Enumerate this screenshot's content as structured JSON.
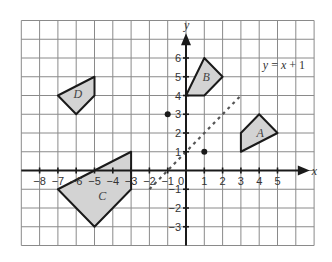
{
  "diagram": {
    "type": "coordinate-grid",
    "grid": {
      "x_min": -9,
      "x_max": 7,
      "y_min": -4,
      "y_max": 8,
      "origin_px": [
        186,
        170.5
      ],
      "unit_px_x": 18.3,
      "unit_px_y": 18.75,
      "grid_color": "#8a8a8a"
    },
    "axes": {
      "x_label": "x",
      "y_label": "y",
      "origin_label": "0",
      "x_ticks": [
        -8,
        -7,
        -6,
        -5,
        -4,
        -3,
        -2,
        -1,
        1,
        2,
        3,
        4,
        5
      ],
      "x_tick_labels": [
        "−8",
        "−7",
        "−6",
        "−5",
        "−4",
        "−3",
        "−2",
        "−1",
        "1",
        "2",
        "3",
        "4",
        "5"
      ],
      "y_ticks": [
        -3,
        -2,
        -1,
        1,
        2,
        3,
        4,
        5,
        6
      ],
      "y_tick_labels": [
        "−3",
        "−2",
        "−1",
        "1",
        "2",
        "3",
        "4",
        "5",
        "6"
      ],
      "x_axis_extent": [
        -9,
        6
      ],
      "y_axis_extent": [
        -4,
        7
      ]
    },
    "shapes": [
      {
        "name": "A",
        "label": "A",
        "vertices": [
          [
            3,
            1
          ],
          [
            3,
            2
          ],
          [
            4,
            3
          ],
          [
            5,
            2
          ]
        ],
        "label_pos": [
          3.85,
          1.8
        ],
        "fill": "#d3d3d3"
      },
      {
        "name": "B",
        "label": "B",
        "vertices": [
          [
            0,
            4
          ],
          [
            1,
            6
          ],
          [
            2,
            5
          ],
          [
            1,
            4
          ]
        ],
        "label_pos": [
          0.9,
          4.8
        ],
        "fill": "#d3d3d3"
      },
      {
        "name": "C",
        "label": "C",
        "vertices": [
          [
            -7,
            -1
          ],
          [
            -3,
            1
          ],
          [
            -3,
            -1
          ],
          [
            -5,
            -3
          ]
        ],
        "label_pos": [
          -4.8,
          -1.55
        ],
        "fill": "#d3d3d3"
      },
      {
        "name": "D",
        "label": "D",
        "vertices": [
          [
            -7,
            4
          ],
          [
            -5,
            5
          ],
          [
            -5,
            4
          ],
          [
            -6,
            3
          ]
        ],
        "label_pos": [
          -6.15,
          3.85
        ],
        "fill": "#d3d3d3"
      }
    ],
    "line": {
      "label_prefix": "y",
      "label_eq": " = ",
      "label_x": "x",
      "label_suffix": " + 1",
      "from": [
        -2,
        -1
      ],
      "to": [
        3,
        4
      ],
      "label_pos": [
        4.2,
        5.4
      ],
      "style": "dashed"
    },
    "points": [
      {
        "name": "point-neg1-3",
        "coords": [
          -1,
          3
        ]
      },
      {
        "name": "point-1-1",
        "coords": [
          1,
          1
        ]
      }
    ]
  }
}
